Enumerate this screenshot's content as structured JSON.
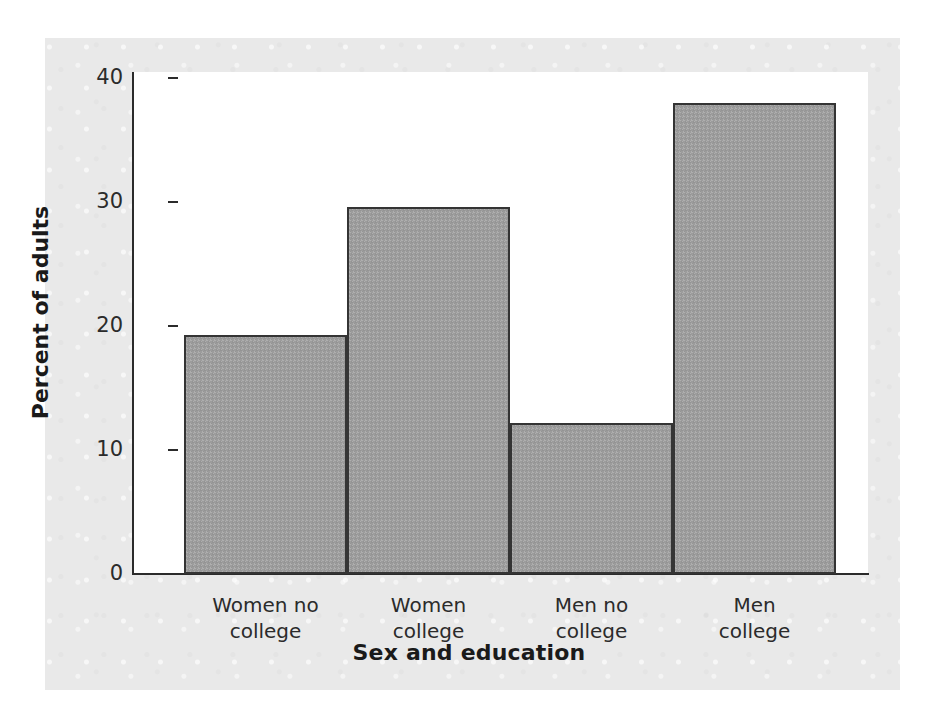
{
  "chart_data": {
    "type": "bar",
    "title": "",
    "xlabel": "Sex and education",
    "ylabel": "Percent of adults",
    "categories": [
      "Women no college",
      "Women college",
      "Men no college",
      "Men college"
    ],
    "category_lines": [
      [
        "Women no",
        "college"
      ],
      [
        "Women",
        "college"
      ],
      [
        "Men no",
        "college"
      ],
      [
        "Men",
        "college"
      ]
    ],
    "values": [
      19.3,
      29.6,
      12.2,
      38.0
    ],
    "ylim": [
      0,
      40
    ],
    "yticks": [
      0,
      10,
      20,
      30,
      40
    ],
    "ytick_labels": [
      "0",
      "10",
      "20",
      "30",
      "40"
    ],
    "grid": false,
    "legend": false,
    "bar_gap": 0
  },
  "style": {
    "bar_fill": "#9c9c9c",
    "bar_edge": "#343434",
    "axis_color": "#2b2b2b",
    "panel_background": "#ffffff",
    "page_background": "#e9e9e9",
    "text_color": "#1a1a1a"
  },
  "ticks": {
    "t0": "0",
    "t10": "10",
    "t20": "20",
    "t30": "30",
    "t40": "40"
  },
  "bars": {
    "b0": "19.3",
    "b1": "29.6",
    "b2": "12.2",
    "b3": "38.0"
  },
  "labels": {
    "c0l0": "Women no",
    "c0l1": "college",
    "c1l0": "Women",
    "c1l1": "college",
    "c2l0": "Men no",
    "c2l1": "college",
    "c3l0": "Men",
    "c3l1": "college"
  }
}
